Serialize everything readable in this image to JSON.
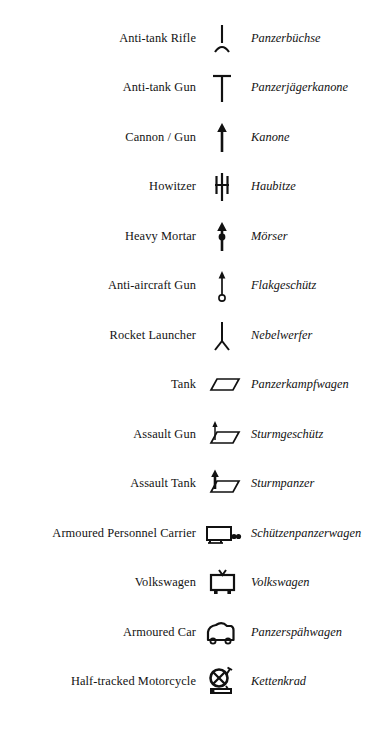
{
  "document": {
    "type": "military-symbol-legend",
    "columns": [
      "English term",
      "Symbol",
      "German term"
    ],
    "background_color": "#ffffff",
    "ink_color": "#131313"
  },
  "rows": [
    {
      "english": "Anti-tank Rifle",
      "symbol": "anti-tank-rifle-symbol",
      "german": "Panzerbüchse"
    },
    {
      "english": "Anti-tank Gun",
      "symbol": "anti-tank-gun-symbol",
      "german": "Panzerjägerkanone"
    },
    {
      "english": "Cannon / Gun",
      "symbol": "cannon-gun-symbol",
      "german": "Kanone"
    },
    {
      "english": "Howitzer",
      "symbol": "howitzer-symbol",
      "german": "Haubitze"
    },
    {
      "english": "Heavy Mortar",
      "symbol": "heavy-mortar-symbol",
      "german": "Mörser"
    },
    {
      "english": "Anti-aircraft Gun",
      "symbol": "anti-aircraft-gun-symbol",
      "german": "Flakgeschütz"
    },
    {
      "english": "Rocket Launcher",
      "symbol": "rocket-launcher-symbol",
      "german": "Nebelwerfer"
    },
    {
      "english": "Tank",
      "symbol": "tank-symbol",
      "german": "Panzerkampfwagen"
    },
    {
      "english": "Assault Gun",
      "symbol": "assault-gun-symbol",
      "german": "Sturmgeschütz"
    },
    {
      "english": "Assault Tank",
      "symbol": "assault-tank-symbol",
      "german": "Sturmpanzer"
    },
    {
      "english": "Armoured Personnel Carrier",
      "symbol": "armoured-personnel-carrier-symbol",
      "german": "Schützenpanzerwagen"
    },
    {
      "english": "Volkswagen",
      "symbol": "volkswagen-symbol",
      "german": "Volkswagen"
    },
    {
      "english": "Armoured Car",
      "symbol": "armoured-car-symbol",
      "german": "Panzerspähwagen"
    },
    {
      "english": "Half-tracked Motorcycle",
      "symbol": "half-tracked-motorcycle-symbol",
      "german": "Kettenkrad"
    }
  ]
}
